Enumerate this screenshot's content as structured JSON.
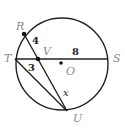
{
  "diagram": {
    "type": "circle-intersecting-chords",
    "colors": {
      "stroke": "#222222",
      "point_label": "#8a8a8a",
      "segment_label": "#222222",
      "background": "#ffffff"
    },
    "circle": {
      "center_label": "O",
      "cx": 62,
      "cy": 64,
      "r": 46
    },
    "points": {
      "R": {
        "label": "R",
        "x": 24,
        "y": 34
      },
      "T": {
        "label": "T",
        "x": 15,
        "y": 59
      },
      "S": {
        "label": "S",
        "x": 107,
        "y": 59
      },
      "U": {
        "label": "U",
        "x": 67,
        "y": 111
      },
      "V": {
        "label": "V",
        "x": 38,
        "y": 59
      },
      "O": {
        "label": "O",
        "x": 61,
        "y": 63
      }
    },
    "segments": [
      {
        "from": "T",
        "to": "S",
        "name": "chord-TS"
      },
      {
        "from": "R",
        "to": "U",
        "name": "chord-RU"
      },
      {
        "from": "T",
        "to": "U",
        "name": "segment-TU"
      }
    ],
    "segment_labels": {
      "RV": "4",
      "VS": "8",
      "TV": "3",
      "VU": "x"
    }
  }
}
